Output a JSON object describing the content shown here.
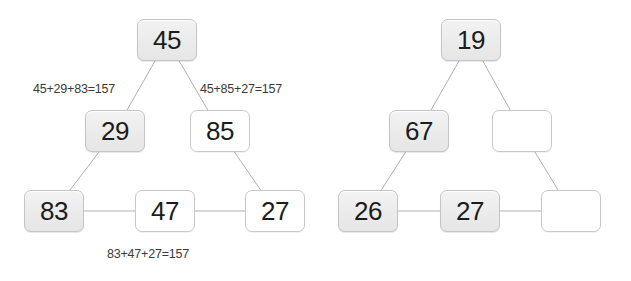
{
  "diagrams": [
    {
      "name": "solved-magic-triangle",
      "nodes": [
        {
          "id": "left-apex",
          "value": "45",
          "state": "filled",
          "x": 137,
          "y": 19
        },
        {
          "id": "left-mid-left",
          "value": "29",
          "state": "filled",
          "x": 85,
          "y": 110
        },
        {
          "id": "left-mid-right",
          "value": "85",
          "state": "empty",
          "x": 190,
          "y": 110
        },
        {
          "id": "left-bottom-left",
          "value": "83",
          "state": "filled",
          "x": 24,
          "y": 190
        },
        {
          "id": "left-bottom-mid",
          "value": "47",
          "state": "empty",
          "x": 135,
          "y": 190
        },
        {
          "id": "left-bottom-right",
          "value": "27",
          "state": "empty",
          "x": 245,
          "y": 190
        }
      ],
      "edges": [
        {
          "from": "left-apex",
          "to": "left-mid-left"
        },
        {
          "from": "left-apex",
          "to": "left-mid-right"
        },
        {
          "from": "left-mid-left",
          "to": "left-bottom-left"
        },
        {
          "from": "left-mid-right",
          "to": "left-bottom-right"
        },
        {
          "from": "left-bottom-left",
          "to": "left-bottom-mid"
        },
        {
          "from": "left-bottom-mid",
          "to": "left-bottom-right"
        }
      ],
      "sum_labels": [
        {
          "id": "left-side-sum",
          "text": "45+29+83=157",
          "x": 33,
          "y": 82
        },
        {
          "id": "right-side-sum",
          "text": "45+85+27=157",
          "x": 200,
          "y": 82
        },
        {
          "id": "bottom-side-sum",
          "text": "83+47+27=157",
          "x": 107,
          "y": 247
        }
      ]
    },
    {
      "name": "blank-magic-triangle",
      "nodes": [
        {
          "id": "right-apex",
          "value": "19",
          "state": "filled",
          "x": 441,
          "y": 19
        },
        {
          "id": "right-mid-left",
          "value": "67",
          "state": "filled",
          "x": 389,
          "y": 110
        },
        {
          "id": "right-mid-right",
          "value": "",
          "state": "empty",
          "x": 492,
          "y": 110
        },
        {
          "id": "right-bottom-left",
          "value": "26",
          "state": "filled",
          "x": 338,
          "y": 190
        },
        {
          "id": "right-bottom-mid",
          "value": "27",
          "state": "filled",
          "x": 440,
          "y": 190
        },
        {
          "id": "right-bottom-right",
          "value": "",
          "state": "empty",
          "x": 541,
          "y": 190
        }
      ],
      "edges": [
        {
          "from": "right-apex",
          "to": "right-mid-left"
        },
        {
          "from": "right-apex",
          "to": "right-mid-right"
        },
        {
          "from": "right-mid-left",
          "to": "right-bottom-left"
        },
        {
          "from": "right-mid-right",
          "to": "right-bottom-right"
        },
        {
          "from": "right-bottom-left",
          "to": "right-bottom-mid"
        },
        {
          "from": "right-bottom-mid",
          "to": "right-bottom-right"
        }
      ],
      "sum_labels": []
    }
  ],
  "colors": {
    "background": "#ffffff",
    "node_filled": "#ededed",
    "node_empty": "#ffffff",
    "node_border": "#c9c9c9",
    "edge_line": "#b0b0b0",
    "text": "#1c1c1c",
    "label_text": "#3a3a3a"
  }
}
